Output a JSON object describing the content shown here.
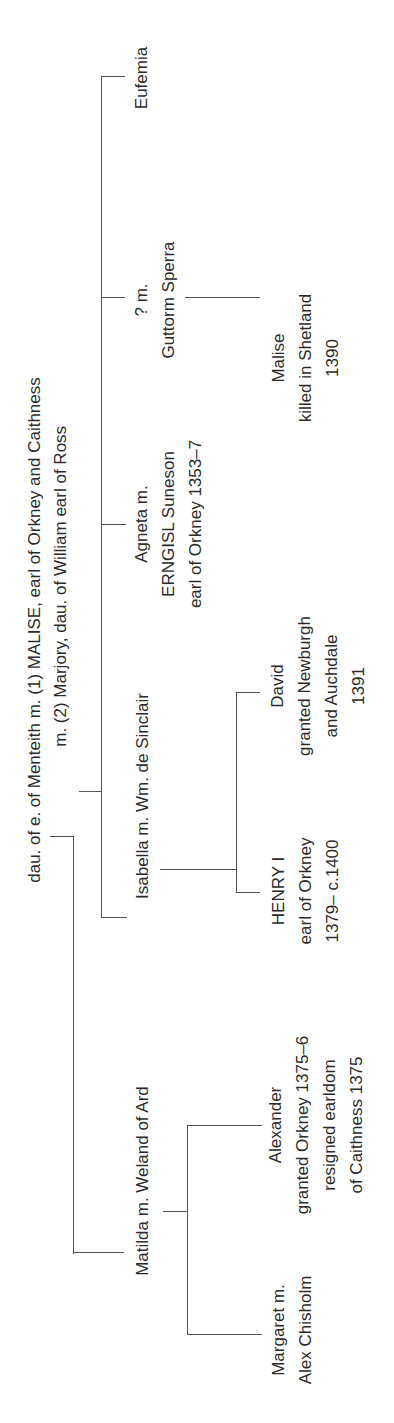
{
  "diagram": {
    "type": "genealogy-tree",
    "orientation": "rotated-90-ccw",
    "parents": {
      "line1": "dau. of e. of Menteith  m. (1) MALISE, earl of Orkney and Caithness",
      "line2": "m. (2) Marjory, dau. of William earl of Ross"
    },
    "children": [
      {
        "id": "matilda",
        "lines": [
          "Matilda m. Weland of Ard"
        ],
        "children": [
          {
            "id": "margaret",
            "lines": [
              "Margaret m.",
              "Alex Chisholm"
            ]
          },
          {
            "id": "alexander",
            "lines": [
              "Alexander",
              "granted Orkney 1375–6",
              "resigned earldom",
              "of Caithness 1375"
            ]
          }
        ]
      },
      {
        "id": "isabella",
        "lines": [
          "Isabella m. Wm. de Sinclair"
        ],
        "children": [
          {
            "id": "henry",
            "lines": [
              "HENRY I",
              "earl of Orkney",
              "1379– c.1400"
            ]
          },
          {
            "id": "david",
            "lines": [
              "David",
              "granted Newburgh",
              "and Auchdale",
              "1391"
            ]
          }
        ]
      },
      {
        "id": "agneta",
        "lines": [
          "Agneta m.",
          "ERNGISL Suneson",
          "earl of Orkney 1353–7"
        ]
      },
      {
        "id": "unknown",
        "lines": [
          "? m.",
          "Guttorm Sperra"
        ],
        "children": [
          {
            "id": "malise-jr",
            "lines": [
              "Malise",
              "killed in Shetland",
              "1390"
            ]
          }
        ]
      },
      {
        "id": "eufemia",
        "lines": [
          "Eufemia"
        ]
      }
    ],
    "colors": {
      "line": "#555555",
      "text": "#2b2b2b",
      "background": "#ffffff"
    }
  }
}
